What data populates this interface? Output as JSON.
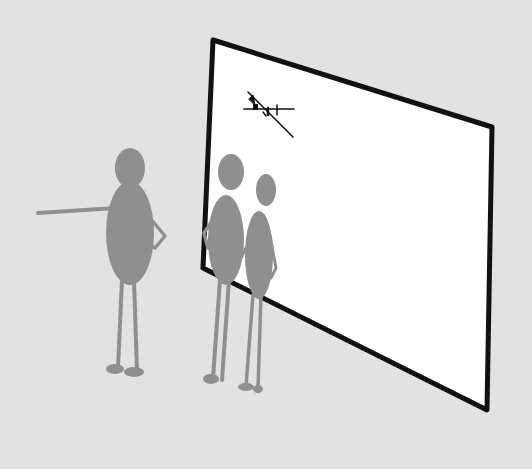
{
  "scene": {
    "description": "Hand-drawn illustration: three grey silhouette figures standing before a large white screen/whiteboard with a tiny scribble",
    "colors": {
      "background": "#e2e2e2",
      "screen_fill": "#ffffff",
      "screen_border": "#111111",
      "figure": "#8f8f8f",
      "scribble": "#111111"
    },
    "figures": [
      {
        "name": "pointing-person",
        "pose": "arm extended pointing left, other hand on hip"
      },
      {
        "name": "middle-person",
        "pose": "hand on hip, facing screen"
      },
      {
        "name": "small-person",
        "pose": "standing beside middle person, facing screen"
      }
    ],
    "screen_content": "small scribbled sketch"
  }
}
